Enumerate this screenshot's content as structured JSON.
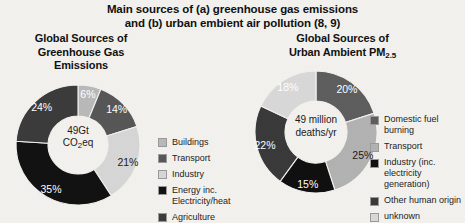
{
  "figure": {
    "title_lines": [
      "Main sources of (a) greenhouse gas emissions",
      "and (b) urban embient air pollution (8, 9)"
    ]
  },
  "panels": [
    {
      "id": "greenhouse-gas",
      "title_lines": [
        "Global Sources of",
        "Greenhouse Gas",
        "Emissions"
      ],
      "center_lines": [
        "49Gt",
        "CO2eq"
      ],
      "center_line2_pre": "CO",
      "center_line2_sub": "2",
      "center_line2_post": "eq"
    },
    {
      "id": "urban-pm25",
      "title_lines": [
        "Global Sources of",
        "Urban Ambient PM2.5"
      ],
      "title_line2_pre": "Urban Ambient PM",
      "title_line2_sub": "2.5",
      "center_lines": [
        "49 million",
        "deaths/yr"
      ]
    }
  ],
  "chart_data": [
    {
      "type": "pie",
      "id": "greenhouse-gas-donut",
      "title": "Global Sources of Greenhouse Gas Emissions",
      "center_label": "49Gt CO2eq",
      "total_label": "49Gt CO2eq",
      "legend_position": "right",
      "categories": [
        "Buildings",
        "Transport",
        "Industry",
        "Energy inc. Electricity/heat",
        "Agriculture"
      ],
      "values": [
        6,
        14,
        21,
        35,
        24
      ],
      "value_labels": [
        "6%",
        "14%",
        "21%",
        "35%",
        "24%"
      ],
      "colors": [
        "#b9b9b9",
        "#575757",
        "#d6d6d6",
        "#121212",
        "#3c3c3c"
      ],
      "label_colors": [
        "#ffffff",
        "#ffffff",
        "#1a1a1a",
        "#ffffff",
        "#ffffff"
      ],
      "legend": [
        {
          "label": "Buildings",
          "color": "#b9b9b9"
        },
        {
          "label": "Transport",
          "color": "#575757"
        },
        {
          "label": "Industry",
          "color": "#d6d6d6"
        },
        {
          "label": "Energy inc. Electricity/heat",
          "color": "#121212"
        },
        {
          "label": "Agriculture",
          "color": "#3c3c3c"
        }
      ]
    },
    {
      "type": "pie",
      "id": "urban-pm25-donut",
      "title": "Global Sources of Urban Ambient PM2.5",
      "center_label": "49 million deaths/yr",
      "total_label": "49 million deaths/yr",
      "legend_position": "right",
      "categories": [
        "Domestic fuel burning",
        "Transport",
        "Industry (inc. electricity generation)",
        "Other human origin",
        "unknown"
      ],
      "values": [
        20,
        25,
        15,
        22,
        18
      ],
      "value_labels": [
        "20%",
        "25%",
        "15%",
        "22%",
        "18%"
      ],
      "colors": [
        "#5e5e5e",
        "#b2b2b2",
        "#101010",
        "#3a3a3a",
        "#d8d8d8"
      ],
      "label_colors": [
        "#ffffff",
        "#1a1a1a",
        "#ffffff",
        "#ffffff",
        "#ffffff"
      ],
      "legend": [
        {
          "label": "Domestic fuel burning",
          "color": "#5e5e5e"
        },
        {
          "label": "Transport",
          "color": "#b2b2b2"
        },
        {
          "label": "Industry (inc. electricity generation)",
          "color": "#101010"
        },
        {
          "label": "Other human origin",
          "color": "#3a3a3a"
        },
        {
          "label": "unknown",
          "color": "#d8d8d8"
        }
      ]
    }
  ]
}
